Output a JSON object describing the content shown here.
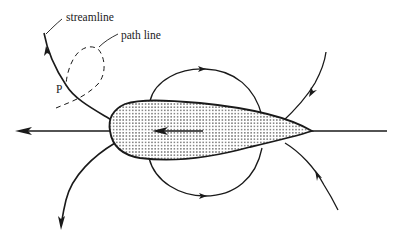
{
  "diagram": {
    "labels": {
      "streamline": "streamline",
      "path_line": "path line",
      "point": "P"
    },
    "colors": {
      "stroke": "#1a1a1a",
      "dots": "#555555",
      "background": "#ffffff",
      "fill": "#ffffff"
    },
    "elements": [
      "airfoil-body (dotted fill)",
      "airfoil-motion-arrow (pointing left)",
      "upper-closed-streamline (clockwise)",
      "lower-closed-streamline",
      "upstream-stagnation-line (arrow to left)",
      "wake-line (to right)",
      "upper-left-streamline (through P)",
      "lower-left-streamline",
      "upper-right-streamline",
      "lower-right-streamline",
      "path-line (dashed loop)"
    ]
  }
}
